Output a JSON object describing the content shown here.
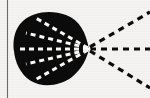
{
  "figure": {
    "canvas": {
      "width": 150,
      "height": 98
    },
    "colors": {
      "background": "#f4f3f1",
      "ink": "#0b0b0b",
      "dash_light": "#fbfaf8",
      "margin_rule": "#6b6b6b"
    },
    "margin_rule": {
      "name": "page-margin-line",
      "x": 7.5,
      "y_top": 0,
      "y_bottom": 98,
      "stroke_width": 1.1
    },
    "blob": {
      "name": "solid-black-lobe",
      "description": "filled black teardrop/circular lobe tapering to a point at the right",
      "vertex_x": 89,
      "vertex_y": 49,
      "left_x": 14,
      "top_y": 13,
      "bottom_y": 85,
      "path": "M 89 49 C 86 33 80 20 66 15 C 52 10 34 11 23 21 C 13 30 13 44 14 51 C 15 62 20 74 31 81 C 43 88 60 86 72 77 C 82 69 87 58 89 49 Z"
    },
    "inner_rays": {
      "name": "white-dashed-rays",
      "dash_pattern": "5 4",
      "stroke_width": 3.0,
      "count": 5,
      "lines": [
        {
          "id": "inner-ray-up-steep",
          "x1": 88,
          "y1": 48,
          "x2": 34,
          "y2": 17
        },
        {
          "id": "inner-ray-up-shallow",
          "x1": 88,
          "y1": 48,
          "x2": 26,
          "y2": 33
        },
        {
          "id": "inner-ray-horizontal",
          "x1": 88,
          "y1": 49,
          "x2": 16,
          "y2": 49
        },
        {
          "id": "inner-ray-down-shallow",
          "x1": 88,
          "y1": 50,
          "x2": 26,
          "y2": 64
        },
        {
          "id": "inner-ray-down-steep",
          "x1": 88,
          "y1": 50,
          "x2": 35,
          "y2": 80
        }
      ]
    },
    "outer_rays": {
      "name": "black-dashed-rays",
      "dash_pattern": "6 5",
      "stroke_width": 3.2,
      "count": 3,
      "lines": [
        {
          "id": "outer-ray-up",
          "x1": 90,
          "y1": 47,
          "x2": 150,
          "y2": 12
        },
        {
          "id": "outer-ray-horizontal",
          "x1": 90,
          "y1": 49,
          "x2": 150,
          "y2": 49
        },
        {
          "id": "outer-ray-down",
          "x1": 90,
          "y1": 51,
          "x2": 150,
          "y2": 88
        }
      ]
    },
    "vertex_marker": {
      "name": "convergence-point",
      "cx": 89,
      "cy": 49,
      "r": 1.6
    }
  }
}
